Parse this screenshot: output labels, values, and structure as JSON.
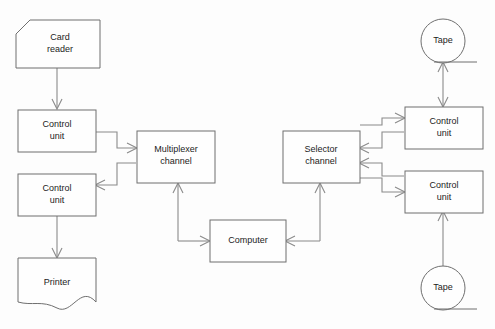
{
  "diagram": {
    "background_color": "#fdfdfd",
    "shape_stroke_color": "#6f6f6f",
    "connector_color": "#8a8a8a",
    "label_color": "#1c1c1c",
    "caption": "",
    "nodes": {
      "card_reader": {
        "label_line1": "Card",
        "label_line2": "reader",
        "shape": "punched-card"
      },
      "control_unit_reader": {
        "label_line1": "Control",
        "label_line2": "unit",
        "shape": "rectangle"
      },
      "control_unit_printer": {
        "label_line1": "Control",
        "label_line2": "unit",
        "shape": "rectangle"
      },
      "printer": {
        "label_line1": "Printer",
        "label_line2": "",
        "shape": "document"
      },
      "multiplexer_channel": {
        "label_line1": "Multiplexer",
        "label_line2": "channel",
        "shape": "rectangle"
      },
      "computer": {
        "label_line1": "Computer",
        "label_line2": "",
        "shape": "rectangle"
      },
      "selector_channel": {
        "label_line1": "Selector",
        "label_line2": "channel",
        "shape": "rectangle"
      },
      "control_unit_tape_top": {
        "label_line1": "Control",
        "label_line2": "unit",
        "shape": "rectangle"
      },
      "control_unit_tape_bottom": {
        "label_line1": "Control",
        "label_line2": "unit",
        "shape": "rectangle"
      },
      "tape_top": {
        "label_line1": "Tape",
        "label_line2": "",
        "shape": "tape-reel"
      },
      "tape_bottom": {
        "label_line1": "Tape",
        "label_line2": "",
        "shape": "tape-reel"
      }
    },
    "connections": [
      {
        "name": "card-reader-to-control-unit",
        "from": "card_reader",
        "to": "control_unit_reader",
        "direction": "one-way"
      },
      {
        "name": "control-unit-reader-to-multiplexer",
        "from": "control_unit_reader",
        "to": "multiplexer_channel",
        "direction": "one-way"
      },
      {
        "name": "multiplexer-to-control-unit-printer",
        "from": "multiplexer_channel",
        "to": "control_unit_printer",
        "direction": "one-way"
      },
      {
        "name": "control-unit-printer-to-printer",
        "from": "control_unit_printer",
        "to": "printer",
        "direction": "one-way"
      },
      {
        "name": "computer-to-multiplexer",
        "from": "computer",
        "to": "multiplexer_channel",
        "direction": "one-way"
      },
      {
        "name": "multiplexer-to-computer",
        "from": "multiplexer_channel",
        "to": "computer",
        "direction": "one-way"
      },
      {
        "name": "computer-to-selector",
        "from": "computer",
        "to": "selector_channel",
        "direction": "one-way"
      },
      {
        "name": "selector-to-computer",
        "from": "selector_channel",
        "to": "computer",
        "direction": "one-way"
      },
      {
        "name": "selector-to-control-unit-tape-top",
        "from": "selector_channel",
        "to": "control_unit_tape_top",
        "direction": "one-way"
      },
      {
        "name": "control-unit-tape-top-to-selector",
        "from": "control_unit_tape_top",
        "to": "selector_channel",
        "direction": "one-way"
      },
      {
        "name": "selector-to-control-unit-tape-bottom",
        "from": "selector_channel",
        "to": "control_unit_tape_bottom",
        "direction": "one-way"
      },
      {
        "name": "control-unit-tape-bottom-to-selector",
        "from": "control_unit_tape_bottom",
        "to": "selector_channel",
        "direction": "one-way"
      },
      {
        "name": "tape-top-control-unit-bidirectional",
        "from": "tape_top",
        "to": "control_unit_tape_top",
        "direction": "two-way"
      },
      {
        "name": "tape-bottom-to-control-unit",
        "from": "tape_bottom",
        "to": "control_unit_tape_bottom",
        "direction": "one-way"
      }
    ]
  }
}
